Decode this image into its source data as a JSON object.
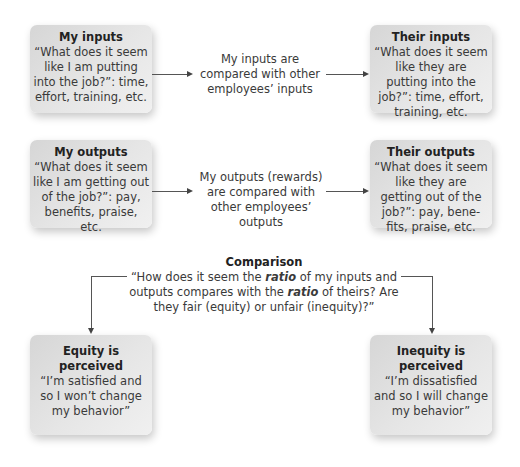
{
  "boxes": {
    "my_inputs": {
      "title": "My inputs",
      "body": "“What does it seem like I am putting into the job?”: time, effort, training, etc."
    },
    "their_inputs": {
      "title": "Their inputs",
      "body": "“What does it seem like they are putting into the job?”: time, effort, training, etc."
    },
    "my_outputs": {
      "title": "My outputs",
      "body": "“What does it seem like I am getting out of the job?”: pay, benefits, praise, etc."
    },
    "their_outputs": {
      "title": "Their outputs",
      "body": "“What does it seem like they are getting out of the job?”: pay, bene-fits, praise, etc."
    },
    "equity": {
      "title": "Equity is perceived",
      "body": "“I’m satisfied and so I won’t change my behavior”"
    },
    "inequity": {
      "title": "Inequity is perceived",
      "body": "“I’m dissatisfied and so I will change my behavior”"
    }
  },
  "connectors": {
    "inputs_label": "My inputs are compared with other employees’ inputs",
    "outputs_label": "My outputs (rewards) are compared with other employees’ outputs"
  },
  "comparison": {
    "title": "Comparison",
    "line1_pre": "“How does it seem the ",
    "ratio_word": "ratio",
    "line1_post": " of my inputs and outputs compares with the ",
    "ratio_word2": "ratio",
    "line2_post": " of theirs? Are they fair (equity) or unfair (inequity)?”"
  }
}
